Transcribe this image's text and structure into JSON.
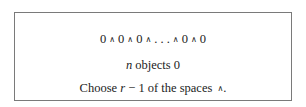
{
  "figure": {
    "line1": {
      "parts": [
        "0",
        "∧",
        "0",
        "∧",
        "0",
        "∧",
        ". . .",
        "∧",
        "0",
        "∧",
        "0"
      ]
    },
    "line2": {
      "var": "n",
      "text": "objects 0"
    },
    "line3": {
      "prefix": "Choose",
      "var": "r",
      "suffix": "− 1 of the spaces",
      "symbol": "∧",
      "end": "."
    }
  }
}
